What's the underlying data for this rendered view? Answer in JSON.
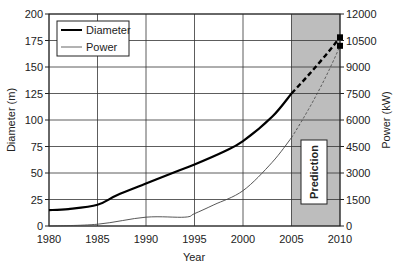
{
  "chart_data": {
    "type": "line",
    "title": "",
    "xlabel": "Year",
    "ylabel": "Diameter (m)",
    "y2label": "Power (kW)",
    "xlim": [
      1980,
      2010
    ],
    "ylim": [
      0,
      200
    ],
    "y2lim": [
      0,
      12000
    ],
    "x_ticks": [
      1980,
      1985,
      1990,
      1995,
      2000,
      2005,
      2010
    ],
    "y_ticks": [
      0,
      25,
      50,
      75,
      100,
      125,
      150,
      175,
      200
    ],
    "y2_ticks": [
      0,
      1500,
      3000,
      4500,
      6000,
      7500,
      9000,
      10500,
      12000
    ],
    "grid": true,
    "legend_position": "upper left",
    "series": [
      {
        "name": "Diameter",
        "axis": "left",
        "style": "thick solid black",
        "x": [
          1980,
          1982,
          1985,
          1987,
          1990,
          1993,
          1995,
          1998,
          2000,
          2003,
          2005
        ],
        "values": [
          15,
          16,
          20,
          29,
          40,
          51,
          58,
          70,
          80,
          103,
          125
        ],
        "prediction": {
          "x": [
            2005,
            2010
          ],
          "values": [
            125,
            178
          ]
        }
      },
      {
        "name": "Power",
        "axis": "right",
        "style": "thin solid gray",
        "x": [
          1980,
          1985,
          1990,
          1994,
          1995,
          1997,
          2000,
          2003,
          2005
        ],
        "values": [
          0,
          100,
          500,
          500,
          700,
          1200,
          2000,
          3600,
          5000
        ],
        "prediction": {
          "x": [
            2005,
            2010
          ],
          "values": [
            5000,
            10200
          ]
        }
      }
    ],
    "annotations": [
      {
        "type": "shaded_region",
        "x_from": 2005,
        "x_to": 2010,
        "label": "Prediction",
        "color": "#bdbdbd"
      }
    ]
  },
  "legend": {
    "diameter": "Diameter",
    "power": "Power"
  },
  "annotation_label": "Prediction",
  "axes": {
    "xlabel": "Year",
    "ylabel": "Diameter (m)",
    "y2label": "Power (kW)"
  },
  "colors": {
    "diameter": "#000000",
    "power": "#555555",
    "grid": "#333333",
    "prediction_bg": "#bdbdbd"
  }
}
